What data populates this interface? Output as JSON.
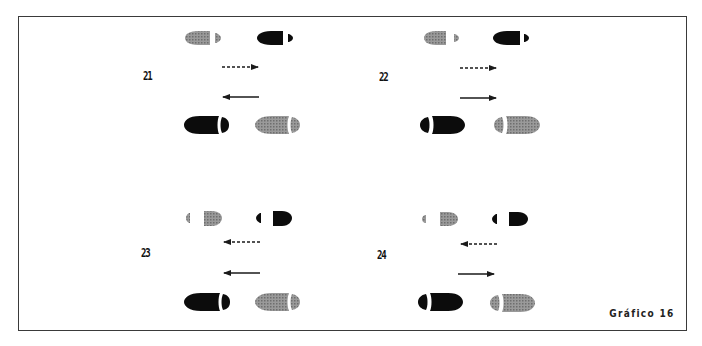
{
  "figure": {
    "caption": "Gráfico 16",
    "panels": [
      {
        "id": "21",
        "label": "21",
        "top_arrow": {
          "style": "dashed",
          "direction": "right"
        },
        "bottom_arrow": {
          "style": "solid",
          "direction": "left"
        },
        "top_prints": "toe-left heel-right",
        "bottom_prints": "toe-left heel-right"
      },
      {
        "id": "22",
        "label": "22",
        "top_arrow": {
          "style": "dashed",
          "direction": "right"
        },
        "bottom_arrow": {
          "style": "solid",
          "direction": "right"
        },
        "top_prints": "toe-left heel-right",
        "bottom_prints": "heel-left toe-right"
      },
      {
        "id": "23",
        "label": "23",
        "top_arrow": {
          "style": "dashed",
          "direction": "left"
        },
        "bottom_arrow": {
          "style": "solid",
          "direction": "left"
        },
        "top_prints": "heel-left toe-right",
        "bottom_prints": "toe-left heel-right"
      },
      {
        "id": "24",
        "label": "24",
        "top_arrow": {
          "style": "dashed",
          "direction": "left"
        },
        "bottom_arrow": {
          "style": "solid",
          "direction": "right"
        },
        "top_prints": "heel-left toe-right",
        "bottom_prints": "heel-left toe-right"
      }
    ],
    "colors": {
      "black_print": "#0c0c0c",
      "grey_print": "#8a8a8a",
      "frame": "#3a3a3a",
      "arrow": "#1a1a1a"
    }
  }
}
